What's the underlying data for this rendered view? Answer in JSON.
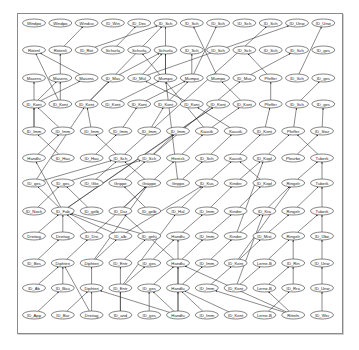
{
  "diagram": {
    "type": "directed-graph",
    "frame": {
      "x": 17,
      "y": 13,
      "w": 324,
      "h": 319
    },
    "node_size": {
      "rx": 11.5,
      "ry": 4
    },
    "colors": {
      "node_stroke": "#333333",
      "edge": "#2a2a2a",
      "node_fill": "#ffffff",
      "frame": "#8a8a8a"
    },
    "rows": [
      {
        "y": 23,
        "x0": 34,
        "dx": 26.3,
        "labels": [
          "Windpo",
          "Windpo",
          "Windco",
          "ID_Win",
          "ID_Dec",
          "ID_Sch",
          "ID_Sch",
          "ID_Sch",
          "ID_Sch",
          "ID_Sch",
          "ID_Unw",
          "ID_Unw"
        ]
      },
      {
        "y": 50,
        "x0": 34,
        "dx": 26.3,
        "labels": [
          "Rötenl",
          "Rötenli",
          "ID_Röt",
          "Schurla",
          "Schurla",
          "Schurla",
          "ID_Sch",
          "ID_Sch",
          "ID_Sch",
          "ID_Sch",
          "ID_Sch",
          "ID_ges"
        ]
      },
      {
        "y": 78,
        "x0": 34,
        "dx": 26.3,
        "labels": [
          "Masens",
          "Masens",
          "Masens",
          "ID_Mas",
          "ID_Mül",
          "Mumpo",
          "Mumpo",
          "Mumpo",
          "ID_Mus",
          "Pfeffer",
          "ID_Sch",
          "ID_ges"
        ]
      },
      {
        "y": 104,
        "x0": 34,
        "dx": 26.3,
        "labels": [
          "ID_Kont",
          "ID_Kont",
          "ID_Kont",
          "ID_Kont",
          "ID_Kont",
          "ID_Kont",
          "ID_Kont",
          "ID_Kont",
          "ID_Kont",
          "Pfeffer",
          "ID_Sch",
          "ID_ges"
        ]
      },
      {
        "y": 131,
        "x0": 34,
        "dx": 28.8,
        "labels": [
          "ID_Imm",
          "ID_Imm",
          "ID_Imm",
          "ID_Imm",
          "ID_Imm",
          "ID_Imm",
          "Kaustk",
          "Kaustk",
          "ID_Kont",
          "Pfeffer",
          "ID_Star"
        ]
      },
      {
        "y": 158,
        "x0": 34,
        "dx": 28.8,
        "labels": [
          "Handlu",
          "ID_Hau",
          "ID_Hau",
          "ID_Sch",
          "ID_Sch",
          "Hereck",
          "ID_Sch",
          "Kaustk",
          "ID_Kopf",
          "Pleurbe",
          "Tuberk"
        ]
      },
      {
        "y": 183,
        "x0": 34,
        "dx": 28.8,
        "labels": [
          "ID_ges",
          "ID_ges",
          "ID_Glie",
          "Grippe",
          "Gräppe",
          "Grippe",
          "ID_Kus",
          "Kinder",
          "ID_Kopf",
          "Ringelr",
          "Tuberk"
        ]
      },
      {
        "y": 211,
        "x0": 34,
        "dx": 28.8,
        "labels": [
          "ID_Noch",
          "ID_Fab",
          "ID_gelb",
          "ID_Dar",
          "ID_gelb",
          "ID_Hal",
          "ID_Imm",
          "Kinder",
          "ID_Kra",
          "Ringelr",
          "Tuberk"
        ]
      },
      {
        "y": 236,
        "x0": 34,
        "dx": 28.8,
        "labels": [
          "Dreitag",
          "Dreitag",
          "ID_Dre",
          "ID_alb",
          "ID_gefü",
          "Handlu",
          "ID_Imm",
          "Kinder",
          "ID_Mist",
          "Ringelr",
          "ID_Übe"
        ]
      },
      {
        "y": 263,
        "x0": 34,
        "dx": 28.8,
        "labels": [
          "ID_Bes",
          "Diphteri",
          "Diphteri",
          "ID_Entr",
          "ID_ges",
          "Handlu",
          "ID_Imm",
          "ID_Kont",
          "Lerne-B",
          "ID_Rin",
          "ID_Unw"
        ]
      },
      {
        "y": 288,
        "x0": 34,
        "dx": 28.8,
        "labels": [
          "ID_Ab",
          "ID_Bau",
          "Diphteri",
          "ID_Entr",
          "ID_ges",
          "Handlu",
          "ID_Imm",
          "ID_Kont",
          "Lerne-B",
          "ID_Rra",
          "ID_Unw"
        ]
      },
      {
        "y": 315,
        "x0": 34,
        "dx": 28.8,
        "labels": [
          "ID_App",
          "ID_Bar",
          "Dreitag",
          "ID_and",
          "ID_ges",
          "Handlu",
          "ID_Imm",
          "ID_Kont",
          "Lerne-B",
          "Ritteln",
          "ID_Wei"
        ]
      }
    ],
    "edges": [
      [
        1,
        2,
        0,
        5
      ],
      [
        1,
        3,
        0,
        4
      ],
      [
        1,
        1,
        0,
        2
      ],
      [
        2,
        4,
        0,
        10
      ],
      [
        2,
        5,
        0,
        5
      ],
      [
        2,
        6,
        0,
        7
      ],
      [
        2,
        7,
        0,
        6
      ],
      [
        2,
        3,
        1,
        5
      ],
      [
        2,
        4,
        1,
        5
      ],
      [
        2,
        5,
        1,
        5
      ],
      [
        2,
        2,
        1,
        0
      ],
      [
        2,
        1,
        1,
        1
      ],
      [
        2,
        6,
        1,
        6
      ],
      [
        2,
        8,
        1,
        10
      ],
      [
        2,
        9,
        1,
        8
      ],
      [
        3,
        0,
        2,
        1
      ],
      [
        3,
        0,
        2,
        2
      ],
      [
        3,
        1,
        2,
        1
      ],
      [
        3,
        2,
        2,
        3
      ],
      [
        3,
        3,
        2,
        5
      ],
      [
        3,
        4,
        2,
        6
      ],
      [
        3,
        5,
        2,
        6
      ],
      [
        3,
        6,
        2,
        4
      ],
      [
        3,
        9,
        2,
        9
      ],
      [
        3,
        10,
        2,
        11
      ],
      [
        3,
        8,
        2,
        7
      ],
      [
        4,
        0,
        3,
        0
      ],
      [
        4,
        1,
        3,
        0
      ],
      [
        4,
        2,
        3,
        2
      ],
      [
        4,
        3,
        3,
        4
      ],
      [
        4,
        4,
        3,
        5
      ],
      [
        4,
        5,
        3,
        7
      ],
      [
        4,
        6,
        3,
        8
      ],
      [
        4,
        7,
        3,
        6
      ],
      [
        4,
        8,
        3,
        9
      ],
      [
        4,
        10,
        3,
        11
      ],
      [
        4,
        9,
        3,
        10
      ],
      [
        5,
        0,
        4,
        1
      ],
      [
        5,
        1,
        4,
        0
      ],
      [
        5,
        2,
        4,
        3
      ],
      [
        5,
        3,
        4,
        2
      ],
      [
        5,
        4,
        4,
        5
      ],
      [
        5,
        5,
        4,
        6
      ],
      [
        5,
        6,
        4,
        7
      ],
      [
        5,
        7,
        4,
        8
      ],
      [
        5,
        8,
        4,
        9
      ],
      [
        5,
        9,
        4,
        10
      ],
      [
        5,
        10,
        4,
        9
      ],
      [
        6,
        0,
        5,
        3
      ],
      [
        6,
        1,
        5,
        4
      ],
      [
        6,
        2,
        5,
        3
      ],
      [
        6,
        3,
        5,
        4
      ],
      [
        6,
        4,
        5,
        3
      ],
      [
        6,
        5,
        5,
        6
      ],
      [
        6,
        6,
        5,
        7
      ],
      [
        6,
        7,
        5,
        8
      ],
      [
        6,
        8,
        5,
        7
      ],
      [
        6,
        9,
        5,
        10
      ],
      [
        6,
        10,
        5,
        10
      ],
      [
        7,
        0,
        6,
        1
      ],
      [
        7,
        1,
        6,
        0
      ],
      [
        7,
        2,
        6,
        1
      ],
      [
        7,
        3,
        6,
        4
      ],
      [
        7,
        4,
        6,
        3
      ],
      [
        7,
        5,
        6,
        6
      ],
      [
        7,
        6,
        6,
        7
      ],
      [
        7,
        7,
        6,
        8
      ],
      [
        7,
        8,
        6,
        9
      ],
      [
        7,
        9,
        6,
        10
      ],
      [
        7,
        10,
        6,
        10
      ],
      [
        8,
        0,
        7,
        1
      ],
      [
        8,
        1,
        7,
        1
      ],
      [
        8,
        2,
        7,
        1
      ],
      [
        8,
        3,
        7,
        1
      ],
      [
        8,
        4,
        7,
        1
      ],
      [
        8,
        5,
        7,
        6
      ],
      [
        8,
        6,
        7,
        7
      ],
      [
        8,
        7,
        7,
        8
      ],
      [
        8,
        8,
        7,
        9
      ],
      [
        8,
        9,
        7,
        10
      ],
      [
        8,
        10,
        7,
        10
      ],
      [
        9,
        0,
        8,
        1
      ],
      [
        9,
        1,
        8,
        2
      ],
      [
        9,
        2,
        8,
        3
      ],
      [
        9,
        3,
        8,
        4
      ],
      [
        9,
        4,
        8,
        5
      ],
      [
        9,
        5,
        8,
        6
      ],
      [
        9,
        6,
        8,
        7
      ],
      [
        9,
        7,
        8,
        8
      ],
      [
        9,
        8,
        8,
        9
      ],
      [
        9,
        9,
        8,
        9
      ],
      [
        9,
        10,
        8,
        10
      ],
      [
        10,
        0,
        9,
        1
      ],
      [
        10,
        1,
        9,
        1
      ],
      [
        10,
        2,
        9,
        2
      ],
      [
        10,
        3,
        9,
        4
      ],
      [
        10,
        4,
        9,
        5
      ],
      [
        10,
        5,
        9,
        6
      ],
      [
        10,
        6,
        9,
        7
      ],
      [
        10,
        7,
        9,
        8
      ],
      [
        10,
        8,
        9,
        9
      ],
      [
        10,
        9,
        9,
        9
      ],
      [
        10,
        10,
        9,
        10
      ],
      [
        11,
        0,
        10,
        1
      ],
      [
        11,
        1,
        10,
        2
      ],
      [
        11,
        2,
        10,
        2
      ],
      [
        11,
        3,
        10,
        3
      ],
      [
        11,
        4,
        10,
        4
      ],
      [
        11,
        5,
        10,
        5
      ],
      [
        11,
        6,
        10,
        5
      ],
      [
        11,
        7,
        10,
        5
      ],
      [
        11,
        8,
        10,
        9
      ],
      [
        11,
        9,
        10,
        8
      ],
      [
        11,
        10,
        10,
        10
      ],
      [
        11,
        2,
        9,
        1
      ],
      [
        11,
        3,
        9,
        3
      ],
      [
        11,
        9,
        9,
        5
      ],
      [
        11,
        9,
        10,
        6
      ],
      [
        11,
        5,
        9,
        5
      ],
      [
        11,
        5,
        10,
        2
      ],
      [
        11,
        5,
        10,
        4
      ],
      [
        10,
        5,
        8,
        5
      ],
      [
        9,
        5,
        7,
        3
      ],
      [
        8,
        3,
        6,
        6
      ],
      [
        7,
        1,
        5,
        0
      ],
      [
        6,
        0,
        3,
        2
      ],
      [
        4,
        0,
        2,
        0
      ],
      [
        3,
        1,
        1,
        0
      ],
      [
        7,
        1,
        4,
        5
      ],
      [
        7,
        1,
        3,
        7
      ],
      [
        8,
        2,
        5,
        5
      ],
      [
        9,
        2,
        6,
        4
      ],
      [
        10,
        3,
        7,
        5
      ],
      [
        5,
        4,
        2,
        8
      ],
      [
        5,
        3,
        0,
        9
      ],
      [
        4,
        6,
        1,
        4
      ],
      [
        6,
        5,
        2,
        5
      ],
      [
        3,
        2,
        0,
        5
      ],
      [
        8,
        7,
        5,
        8
      ],
      [
        9,
        7,
        6,
        9
      ],
      [
        10,
        7,
        7,
        8
      ],
      [
        2,
        10,
        0,
        11
      ]
    ]
  }
}
